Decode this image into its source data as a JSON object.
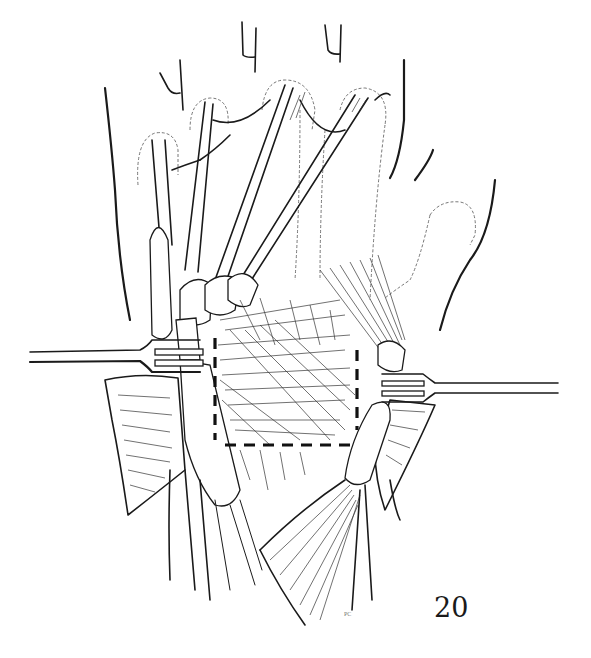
{
  "figure": {
    "number": "20",
    "signature": "PC"
  },
  "colors": {
    "ink": "#1a1a1a",
    "background": "#ffffff",
    "dotted_outline": "#666666"
  }
}
